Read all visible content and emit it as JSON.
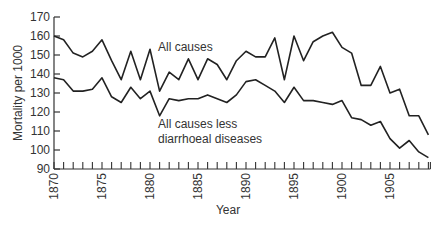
{
  "chart_data": {
    "type": "line",
    "title": "",
    "xlabel": "Year",
    "ylabel": "Mortality per 1000",
    "xlim": [
      1870,
      1909
    ],
    "ylim": [
      90,
      170
    ],
    "grid": false,
    "legend": "inline labels",
    "y_ticks": [
      90,
      100,
      110,
      120,
      130,
      140,
      150,
      160,
      170
    ],
    "x_tick_labels": [
      1870,
      1875,
      1880,
      1885,
      1890,
      1895,
      1900,
      1905
    ],
    "x": [
      1870,
      1871,
      1872,
      1873,
      1874,
      1875,
      1876,
      1877,
      1878,
      1879,
      1880,
      1881,
      1882,
      1883,
      1884,
      1885,
      1886,
      1887,
      1888,
      1889,
      1890,
      1891,
      1892,
      1893,
      1894,
      1895,
      1896,
      1897,
      1898,
      1899,
      1900,
      1901,
      1902,
      1903,
      1904,
      1905,
      1906,
      1907,
      1908,
      1909
    ],
    "series": [
      {
        "name": "All causes",
        "values": [
          160,
          158,
          151,
          149,
          152,
          158,
          147,
          137,
          152,
          137,
          153,
          131,
          141,
          137,
          148,
          137,
          148,
          145,
          137,
          147,
          152,
          149,
          149,
          159,
          137,
          160,
          147,
          157,
          160,
          162,
          154,
          151,
          134,
          134,
          144,
          130,
          132,
          118,
          118,
          108
        ]
      },
      {
        "name": "All causes less diarrhoeal diseases",
        "values": [
          138,
          137,
          131,
          131,
          132,
          138,
          128,
          125,
          133,
          127,
          131,
          118,
          127,
          126,
          127,
          127,
          129,
          127,
          125,
          129,
          136,
          137,
          134,
          131,
          125,
          133,
          126,
          126,
          125,
          124,
          126,
          117,
          116,
          113,
          115,
          106,
          101,
          105,
          99,
          96
        ]
      }
    ],
    "annotations": [
      {
        "text": "All causes",
        "near_series": 0
      },
      {
        "text": "All causes less",
        "near_series": 1
      },
      {
        "text": "diarrhoeal diseases",
        "near_series": 1
      }
    ]
  },
  "labels": {
    "xlabel": "Year",
    "ylabel": "Mortality per 1000",
    "series0": "All causes",
    "series1_line1": "All causes less",
    "series1_line2": "diarrhoeal diseases"
  }
}
